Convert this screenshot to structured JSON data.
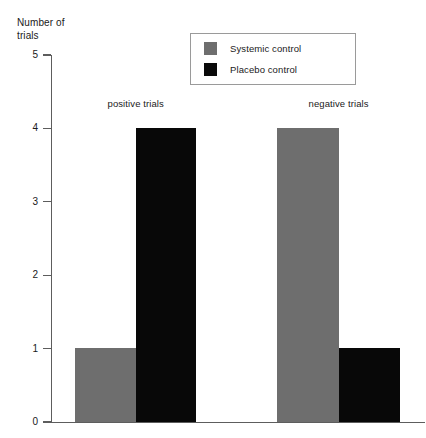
{
  "chart_data": {
    "type": "bar",
    "title": "",
    "subtitle": "",
    "xlabel": "",
    "ylabel": "Number of\ntrials",
    "ylim": [
      0,
      5
    ],
    "yticks": [
      0,
      1,
      2,
      3,
      4,
      5
    ],
    "ytick_labels": [
      "0",
      "1",
      "2",
      "3",
      "4",
      "5"
    ],
    "grid": false,
    "categories": [
      "positive trials",
      "negative trials"
    ],
    "series": [
      {
        "name": "Systemic control",
        "color": "#6e6e6e",
        "values": [
          1,
          4
        ]
      },
      {
        "name": "Placebo control",
        "color": "#0a0a0a",
        "values": [
          4,
          1
        ]
      }
    ],
    "legend": {
      "position": "top-center",
      "entries": [
        {
          "label": "Systemic control",
          "swatch": "#6e6e6e"
        },
        {
          "label": "Placebo control",
          "swatch": "#0a0a0a"
        }
      ]
    }
  },
  "axis": {
    "y_title_line1": "Number of",
    "y_title_line2": "trials"
  }
}
